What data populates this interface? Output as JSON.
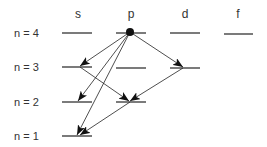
{
  "diagram": {
    "columns": [
      {
        "label": "s",
        "x": 78
      },
      {
        "label": "p",
        "x": 131
      },
      {
        "label": "d",
        "x": 185
      },
      {
        "label": "f",
        "x": 238
      }
    ],
    "rows": [
      {
        "label": "n = 4",
        "y": 33
      },
      {
        "label": "n = 3",
        "y": 67
      },
      {
        "label": "n = 2",
        "y": 102
      },
      {
        "label": "n = 1",
        "y": 136
      }
    ],
    "levels": [
      {
        "id": "4s",
        "x1": 62,
        "x2": 92,
        "y": 33
      },
      {
        "id": "4p",
        "x1": 116,
        "x2": 146,
        "y": 33
      },
      {
        "id": "4d",
        "x1": 170,
        "x2": 200,
        "y": 33
      },
      {
        "id": "4f",
        "x1": 224,
        "x2": 253,
        "y": 34
      },
      {
        "id": "3s",
        "x1": 62,
        "x2": 92,
        "y": 67
      },
      {
        "id": "3p",
        "x1": 116,
        "x2": 146,
        "y": 68
      },
      {
        "id": "3d",
        "x1": 170,
        "x2": 200,
        "y": 68
      },
      {
        "id": "2s",
        "x1": 62,
        "x2": 92,
        "y": 102
      },
      {
        "id": "2p",
        "x1": 116,
        "x2": 146,
        "y": 102
      },
      {
        "id": "1s",
        "x1": 62,
        "x2": 92,
        "y": 136
      }
    ],
    "start_dot": {
      "level": "4p",
      "x": 130,
      "y": 32
    },
    "transitions": [
      {
        "from": "4p",
        "to": "3s",
        "x1": 130,
        "y1": 32,
        "x2": 80,
        "y2": 66
      },
      {
        "from": "4p",
        "to": "2s",
        "x1": 130,
        "y1": 32,
        "x2": 78,
        "y2": 101
      },
      {
        "from": "4p",
        "to": "1s",
        "x1": 130,
        "y1": 32,
        "x2": 77,
        "y2": 135
      },
      {
        "from": "4p",
        "to": "3d",
        "x1": 130,
        "y1": 32,
        "x2": 183,
        "y2": 67
      },
      {
        "from": "3s",
        "to": "2p",
        "x1": 80,
        "y1": 67,
        "x2": 129,
        "y2": 101
      },
      {
        "from": "3d",
        "to": "2p",
        "x1": 183,
        "y1": 68,
        "x2": 130,
        "y2": 101
      },
      {
        "from": "2p",
        "to": "1s",
        "x1": 130,
        "y1": 102,
        "x2": 80,
        "y2": 135
      }
    ],
    "colors": {
      "line": "#222222",
      "text": "#333333",
      "background": "#ffffff"
    }
  }
}
